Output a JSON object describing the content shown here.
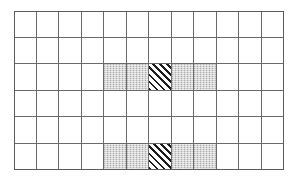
{
  "figure": {
    "title": "",
    "colors": {
      "background": "#ffffff",
      "grid_line": "#6a6a6a",
      "grid_border": "#5a5a5a",
      "shaded_fill": "#c8c8c8",
      "hatched_line": "#1c1c1c"
    }
  },
  "grid": {
    "columns": 12,
    "rows": 6,
    "left": 14,
    "top": 11,
    "width": 270,
    "height": 159,
    "cell_width": 22.5,
    "cell_height": 26.5,
    "fill_legend": {
      "empty": "empty",
      "shaded": "shaded",
      "hatched": "hatched"
    },
    "cells": [
      [
        "empty",
        "empty",
        "empty",
        "empty",
        "empty",
        "empty",
        "empty",
        "empty",
        "empty",
        "empty",
        "empty",
        "empty"
      ],
      [
        "empty",
        "empty",
        "empty",
        "empty",
        "empty",
        "empty",
        "empty",
        "empty",
        "empty",
        "empty",
        "empty",
        "empty"
      ],
      [
        "empty",
        "empty",
        "empty",
        "empty",
        "shaded",
        "shaded",
        "hatched",
        "shaded",
        "shaded",
        "empty",
        "empty",
        "empty"
      ],
      [
        "empty",
        "empty",
        "empty",
        "empty",
        "empty",
        "empty",
        "empty",
        "empty",
        "empty",
        "empty",
        "empty",
        "empty"
      ],
      [
        "empty",
        "empty",
        "empty",
        "empty",
        "empty",
        "empty",
        "empty",
        "empty",
        "empty",
        "empty",
        "empty",
        "empty"
      ],
      [
        "empty",
        "empty",
        "empty",
        "empty",
        "shaded",
        "shaded",
        "hatched",
        "shaded",
        "shaded",
        "empty",
        "empty",
        "empty"
      ]
    ]
  }
}
